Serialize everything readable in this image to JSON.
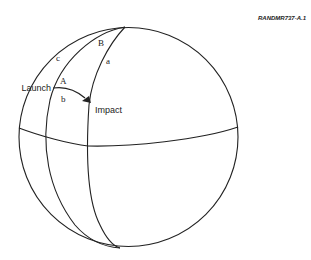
{
  "figure": {
    "id_label": "RANDMR737-A.1",
    "labels": {
      "launch": "Launch",
      "impact": "Impact",
      "A": "A",
      "B": "B",
      "a": "a",
      "b": "b",
      "c": "c"
    },
    "colors": {
      "line": "#222222",
      "background": "#ffffff"
    }
  }
}
